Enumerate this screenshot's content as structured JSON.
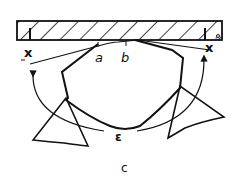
{
  "diagram": {
    "labels": {
      "a": "a",
      "b": "b",
      "epsilon": "ε",
      "left_marker": "x",
      "right_marker": "x",
      "right_marker_superscript": "'",
      "caption": "c"
    },
    "colors": {
      "ink": "#111111",
      "background": "#ffffff"
    }
  }
}
